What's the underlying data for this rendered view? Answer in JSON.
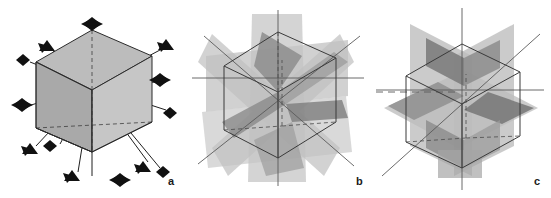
{
  "figure": {
    "background_color": "#ffffff",
    "panels": [
      {
        "id": "a",
        "label": "a",
        "caption": "Rotation axes of the cube",
        "content": "shaded cube with rotation axis symbols projecting from face centres, edge midpoints and corners",
        "cube_style": "solid shaded faces",
        "colors": {
          "face_top": "#b8b8b8",
          "face_left": "#a8a8a8",
          "face_right": "#c4c4c4",
          "edge_line": "#2b2b2b",
          "axis_line": "#1a1a1a",
          "symbol_fill": "#111111"
        },
        "symmetry_symbols": [
          {
            "name": "4-fold-axis-top",
            "type": "4-fold",
            "x": 92,
            "y": 24
          },
          {
            "name": "3-fold-axis-upper-left",
            "type": "3-fold",
            "x": 47,
            "y": 47
          },
          {
            "name": "3-fold-axis-upper-right",
            "type": "3-fold",
            "x": 166,
            "y": 46
          },
          {
            "name": "2-fold-axis-left-upper",
            "type": "2-fold",
            "x": 23,
            "y": 60
          },
          {
            "name": "4-fold-axis-left-face",
            "type": "4-fold",
            "x": 22,
            "y": 105
          },
          {
            "name": "4-fold-axis-right-face",
            "type": "4-fold",
            "x": 160,
            "y": 80
          },
          {
            "name": "2-fold-axis-right-edge",
            "type": "2-fold",
            "x": 170,
            "y": 113
          },
          {
            "name": "3-fold-axis-lower-left",
            "type": "3-fold",
            "x": 30,
            "y": 150
          },
          {
            "name": "2-fold-axis-inner-left",
            "type": "2-fold",
            "x": 50,
            "y": 146
          },
          {
            "name": "3-fold-axis-bottom-left",
            "type": "3-fold",
            "x": 72,
            "y": 177
          },
          {
            "name": "4-fold-axis-bottom",
            "type": "4-fold",
            "x": 120,
            "y": 180
          },
          {
            "name": "3-fold-axis-bottom-right",
            "type": "3-fold",
            "x": 143,
            "y": 168
          },
          {
            "name": "2-fold-axis-far-right",
            "type": "2-fold",
            "x": 163,
            "y": 172
          }
        ]
      },
      {
        "id": "b",
        "label": "b",
        "caption": "Diagonal mirror planes of the cube",
        "content": "wireframe cube intersected by six diagonal mirror planes passing through opposite edges",
        "cube_style": "wireframe outline",
        "plane_count": 6,
        "colors": {
          "plane_light": "#c9c9c9",
          "plane_mid": "#a5a5a5",
          "plane_dark": "#6e6e6e",
          "edge_line": "#3a3a3a",
          "axis_line": "#555555"
        }
      },
      {
        "id": "c",
        "label": "c",
        "caption": "Axial mirror planes of the cube",
        "content": "wireframe cube intersected by three mirror planes parallel to the cube faces",
        "cube_style": "wireframe outline",
        "plane_count": 3,
        "colors": {
          "plane_light": "#c9c9c9",
          "plane_mid": "#a0a0a0",
          "plane_dark": "#6a6a6a",
          "edge_line": "#3a3a3a",
          "axis_line": "#555555"
        }
      }
    ]
  }
}
